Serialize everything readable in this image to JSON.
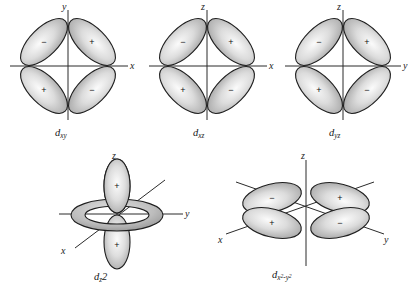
{
  "figure": {
    "background_color": "#ffffff",
    "line_color": "#2b2b2b",
    "lobe_outline_color": "#1f1f1f",
    "lobe_fill_light": "#f2f2f2",
    "lobe_fill_mid": "#c9c9c9",
    "lobe_fill_dark": "#8f8f8f"
  },
  "orbitals": [
    {
      "id": "dxy",
      "label_base": "d",
      "label_sub": "xy",
      "axes": [
        {
          "name": "vertical-axis",
          "label": "y"
        },
        {
          "name": "horizontal-axis",
          "label": "x"
        }
      ],
      "lobes": [
        {
          "position": "upper-left",
          "sign": "−"
        },
        {
          "position": "upper-right",
          "sign": "+"
        },
        {
          "position": "lower-left",
          "sign": "+"
        },
        {
          "position": "lower-right",
          "sign": "−"
        }
      ]
    },
    {
      "id": "dxz",
      "label_base": "d",
      "label_sub": "xz",
      "axes": [
        {
          "name": "vertical-axis",
          "label": "z"
        },
        {
          "name": "horizontal-axis",
          "label": "x"
        }
      ],
      "lobes": [
        {
          "position": "upper-left",
          "sign": "−"
        },
        {
          "position": "upper-right",
          "sign": "+"
        },
        {
          "position": "lower-left",
          "sign": "+"
        },
        {
          "position": "lower-right",
          "sign": "−"
        }
      ]
    },
    {
      "id": "dyz",
      "label_base": "d",
      "label_sub": "yz",
      "axes": [
        {
          "name": "vertical-axis",
          "label": "z"
        },
        {
          "name": "horizontal-axis",
          "label": "y"
        }
      ],
      "lobes": [
        {
          "position": "upper-left",
          "sign": "−"
        },
        {
          "position": "upper-right",
          "sign": "+"
        },
        {
          "position": "lower-left",
          "sign": "+"
        },
        {
          "position": "lower-right",
          "sign": "−"
        }
      ]
    },
    {
      "id": "dz2",
      "label_base": "d",
      "label_sub": "z",
      "label_sup": "2",
      "axes": [
        {
          "name": "vertical-axis",
          "label": "z"
        },
        {
          "name": "horizontal-axis",
          "label": "y"
        },
        {
          "name": "diagonal-axis",
          "label": "x"
        }
      ],
      "lobes": [
        {
          "position": "top",
          "sign": "+"
        },
        {
          "position": "bottom",
          "sign": "+"
        }
      ],
      "torus": {
        "name": "equatorial-torus",
        "sign": ""
      }
    },
    {
      "id": "dx2y2",
      "label_base": "d",
      "label_sub_x": "x",
      "label_sup_x": "2",
      "label_minus": "-",
      "label_sub_y": "y",
      "label_sup_y": "2",
      "axes": [
        {
          "name": "vertical-axis",
          "label": "z"
        },
        {
          "name": "diagonal-axis-left",
          "label": "x"
        },
        {
          "name": "diagonal-axis-right",
          "label": "y"
        }
      ],
      "lobes": [
        {
          "position": "upper-left",
          "sign": "−"
        },
        {
          "position": "upper-right",
          "sign": "+"
        },
        {
          "position": "lower-left",
          "sign": "+"
        },
        {
          "position": "lower-right",
          "sign": "−"
        }
      ]
    }
  ]
}
